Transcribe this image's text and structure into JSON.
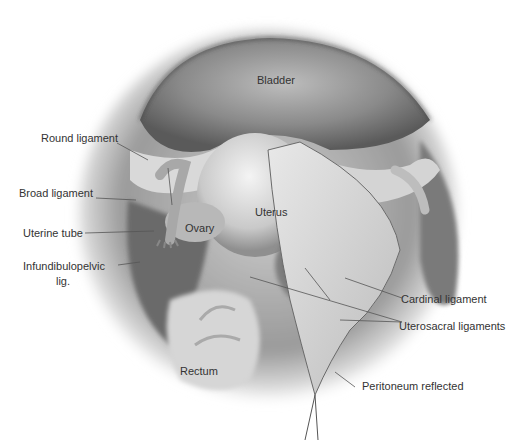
{
  "figure": {
    "type": "anatomical illustration",
    "colors": {
      "background": "#ffffff",
      "label_text": "#333333",
      "leader_line": "#555555"
    }
  },
  "labels": {
    "bladder": "Bladder",
    "round_ligament": "Round ligament",
    "broad_ligament": "Broad ligament",
    "uterine_tube": "Uterine tube",
    "ovary": "Ovary",
    "uterus": "Uterus",
    "infundibulopelvic_line1": "Infundibulopelvic",
    "infundibulopelvic_line2": "lig.",
    "cardinal_ligament": "Cardinal ligament",
    "uterosacral_ligaments": "Uterosacral ligaments",
    "rectum": "Rectum",
    "peritoneum_reflected": "Peritoneum reflected"
  }
}
